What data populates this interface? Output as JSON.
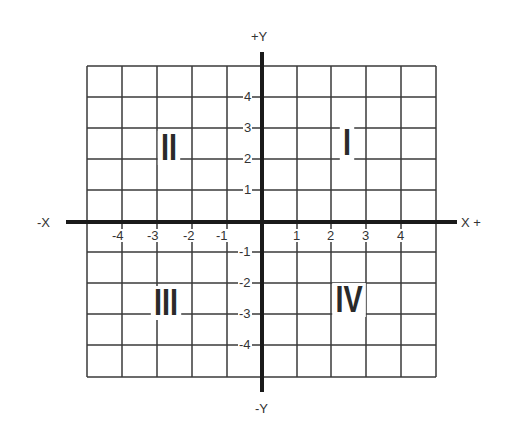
{
  "axes": {
    "y_pos_label": "+Y",
    "y_neg_label": "-Y",
    "x_neg_label": "-X",
    "x_pos_label": "X +"
  },
  "x_ticks": [
    "-4",
    "-3",
    "-2",
    "-1",
    "1",
    "2",
    "3",
    "4"
  ],
  "y_ticks": [
    "4",
    "3",
    "2",
    "1",
    "-1",
    "-2",
    "-3",
    "-4"
  ],
  "quadrants": {
    "q1": "I",
    "q2": "II",
    "q3": "III",
    "q4": "IV"
  },
  "colors": {
    "grid": "#3a3a3a",
    "axis": "#1a1a1a",
    "background": "#ffffff"
  }
}
